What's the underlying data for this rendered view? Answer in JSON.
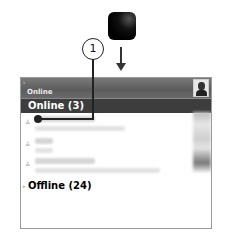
{
  "diagram": {
    "key_icon": "blackberry-key-icon",
    "callout_number": "1"
  },
  "screen": {
    "header": {
      "indicator": "♭",
      "title": "Online"
    },
    "groups": [
      {
        "label": "Online (3)",
        "contacts": [
          {
            "name_width": 60,
            "status_width": 90,
            "icon": "👤"
          },
          {
            "name_width": 18,
            "status_width": 18,
            "icon": "👤"
          },
          {
            "name_width": 60,
            "status_width": 125,
            "icon": "👤"
          }
        ]
      },
      {
        "label": "Offline (24)"
      }
    ]
  }
}
